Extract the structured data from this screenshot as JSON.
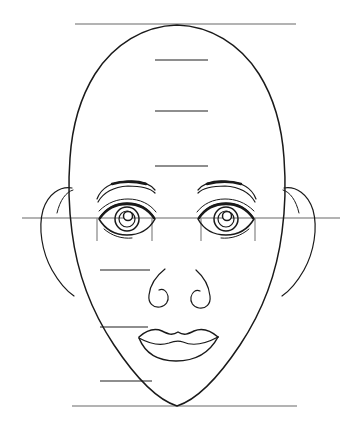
{
  "document": {
    "title": "Face Proportion Study",
    "kind": "line-drawing",
    "background_color": "#ffffff",
    "ink_color": "#1a1a1a",
    "guide_color": "#9a9a9a",
    "width": 353,
    "height": 430
  },
  "guides": {
    "crown_line": {
      "name": "crown-line",
      "y": 24,
      "x1": 75,
      "x2": 296
    },
    "chin_line": {
      "name": "chin-line",
      "y": 406,
      "x1": 72,
      "x2": 297
    },
    "eye_line": {
      "name": "eye-level-line",
      "y": 218,
      "x1": 22,
      "x2": 340
    },
    "center_marks": [
      {
        "name": "hairline-mark",
        "y": 60,
        "x1": 155,
        "x2": 208
      },
      {
        "name": "brow-mark",
        "y": 111,
        "x1": 155,
        "x2": 208
      },
      {
        "name": "upper-brow-mark",
        "y": 166,
        "x1": 155,
        "x2": 208
      }
    ],
    "left_marks": [
      {
        "name": "nose-base-mark",
        "y": 270,
        "x1": 100,
        "x2": 150
      },
      {
        "name": "mouth-line-mark",
        "y": 327,
        "x1": 100,
        "x2": 148
      },
      {
        "name": "chin-crease-mark",
        "y": 381,
        "x1": 100,
        "x2": 152
      }
    ],
    "eye_width_ticks": [
      {
        "name": "eye-tick-outer-left",
        "x": 97,
        "y1": 218,
        "y2": 241
      },
      {
        "name": "eye-tick-inner-left",
        "x": 152,
        "y1": 218,
        "y2": 241
      },
      {
        "name": "eye-tick-inner-right",
        "x": 201,
        "y1": 218,
        "y2": 241
      },
      {
        "name": "eye-tick-outer-right",
        "x": 255,
        "y1": 218,
        "y2": 241
      }
    ]
  },
  "features": {
    "head": {
      "name": "head-outline",
      "crown_y": 24,
      "chin_y": 406,
      "widest_y": 215
    },
    "ears": {
      "name": "ears",
      "left_x": 40,
      "right_x": 313,
      "top_y": 186,
      "bottom_y": 285
    },
    "eyes": {
      "name": "eyes",
      "left": {
        "cx": 125,
        "cy": 220
      },
      "right": {
        "cx": 228,
        "cy": 220
      }
    },
    "brows": {
      "name": "eyebrows",
      "left_cx": 125,
      "right_cx": 228,
      "y": 193
    },
    "nose": {
      "name": "nose",
      "cx": 176,
      "base_y": 300
    },
    "mouth": {
      "name": "mouth",
      "cx": 178,
      "cy": 340,
      "width": 80
    }
  }
}
